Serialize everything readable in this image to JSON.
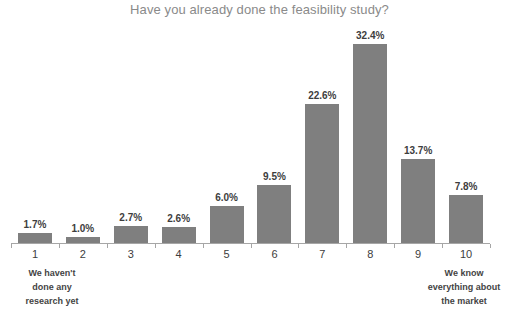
{
  "chart_data": {
    "type": "bar",
    "title": "Have you already done the feasibility study?",
    "subtitle": "",
    "xlabel": "",
    "ylabel": "",
    "categories": [
      "1",
      "2",
      "3",
      "4",
      "5",
      "6",
      "7",
      "8",
      "9",
      "10"
    ],
    "values": [
      1.7,
      1.0,
      2.7,
      2.6,
      6.0,
      9.5,
      22.6,
      32.4,
      13.7,
      7.8
    ],
    "value_labels": [
      "1.7%",
      "1.0%",
      "2.7%",
      "2.6%",
      "6.0%",
      "9.5%",
      "22.6%",
      "32.4%",
      "13.7%",
      "7.8%"
    ],
    "ylim": [
      0,
      36
    ],
    "grid": false,
    "legend": false,
    "bar_color": "#7f7f7f",
    "axis_color": "#a6a6a6",
    "title_color": "#8a8a8a",
    "label_color": "#3d3d3d",
    "annotations": {
      "left": {
        "line1": "We haven't",
        "line2": "done any",
        "line3": "research yet"
      },
      "right": {
        "line1": "We know",
        "line2": "everything about",
        "line3": "the market"
      }
    }
  }
}
